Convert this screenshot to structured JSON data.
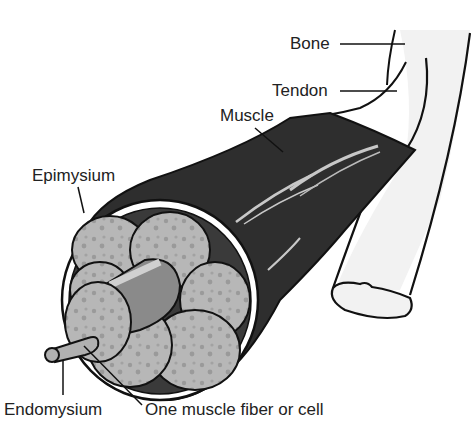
{
  "diagram": {
    "labels": {
      "bone": "Bone",
      "tendon": "Tendon",
      "muscle": "Muscle",
      "epimysium": "Epimysium",
      "endomysium": "Endomysium",
      "fiber": "One muscle fiber or cell"
    },
    "colors": {
      "muscle": "#2e2e2e",
      "fiber": "#b4b4b4",
      "fiber_dots": "#999999",
      "bone": "#f2f2f2",
      "outline": "#111111",
      "highlight": "#c8c8c8"
    }
  }
}
